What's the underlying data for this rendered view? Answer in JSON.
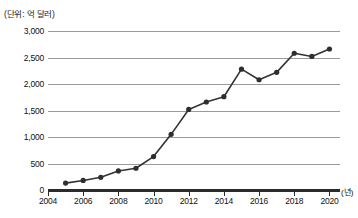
{
  "chart_data": {
    "type": "line",
    "title": "",
    "subtitle": "",
    "unit_label": "(단위: 억 달러)",
    "xlabel": "(년)",
    "ylabel": "",
    "x": [
      2005,
      2006,
      2007,
      2008,
      2009,
      2010,
      2011,
      2012,
      2013,
      2014,
      2015,
      2016,
      2017,
      2018,
      2019,
      2020
    ],
    "values": [
      130,
      180,
      240,
      360,
      410,
      630,
      1050,
      1520,
      1660,
      1760,
      2280,
      2080,
      2220,
      2580,
      2520,
      2660
    ],
    "series": [
      {
        "name": "",
        "values": [
          130,
          180,
          240,
          360,
          410,
          630,
          1050,
          1520,
          1660,
          1760,
          2280,
          2080,
          2220,
          2580,
          2520,
          2660
        ]
      }
    ],
    "xlim": [
      2004,
      2020.6
    ],
    "ylim": [
      0,
      3000
    ],
    "y_ticks": [
      0,
      500,
      1000,
      1500,
      2000,
      2500,
      3000
    ],
    "y_tick_labels": [
      "0",
      "500",
      "1,000",
      "1,500",
      "2,000",
      "2,500",
      "3,000"
    ],
    "x_ticks": [
      2004,
      2006,
      2008,
      2010,
      2012,
      2014,
      2016,
      2018,
      2020
    ],
    "x_tick_labels": [
      "2004",
      "2006",
      "2008",
      "2010",
      "2012",
      "2014",
      "2016",
      "2018",
      "2020"
    ],
    "grid": true,
    "grid_axis": "y",
    "legend": false,
    "legend_position": "none",
    "marker": "circle",
    "colors": {
      "line": "#333333",
      "marker": "#2e2e2e",
      "gridline": "#9a9a9a",
      "axis": "#2b2b2b",
      "text": "#111111",
      "background": "#ffffff"
    }
  }
}
